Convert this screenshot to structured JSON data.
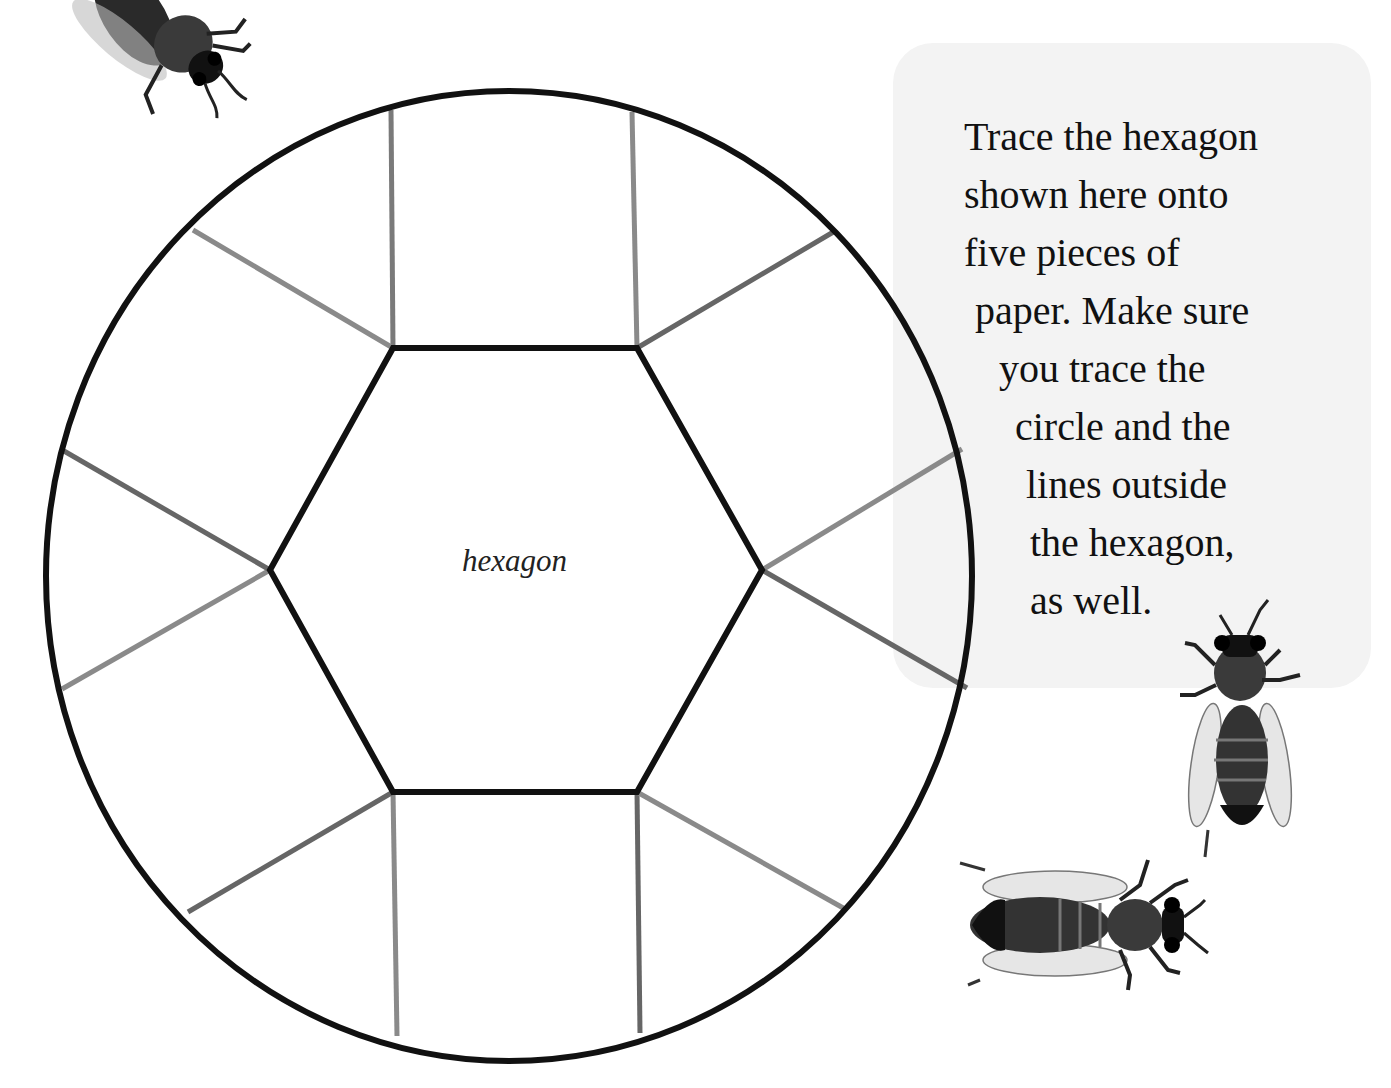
{
  "page": {
    "instructions": {
      "lines": [
        "Trace the hexagon",
        "shown here onto",
        "five pieces of",
        "paper. Make sure",
        "you trace the",
        "circle and the",
        "lines outside",
        "the hexagon,",
        "as well."
      ]
    },
    "diagram": {
      "center_label": "hexagon",
      "outline_color": "#111111",
      "spoke_colors": [
        "#858585",
        "#666666"
      ],
      "panel_color": "#f3f3f3"
    },
    "decorations": {
      "bees": [
        "bee-top-left",
        "bee-right-vertical",
        "bee-bottom-horizontal"
      ]
    }
  }
}
